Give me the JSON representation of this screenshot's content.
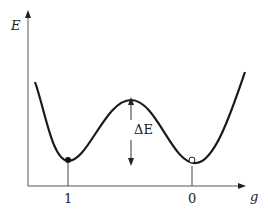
{
  "diagram": {
    "title": "",
    "y_axis_label": "E",
    "x_axis_label": "g",
    "barrier_label": "ΔE",
    "ticks": [
      {
        "label": "1",
        "description": "left minimum, filled marker"
      },
      {
        "label": "0",
        "description": "right minimum, open marker"
      }
    ],
    "curve": "double-well potential energy curve",
    "colors": {
      "line": "#1a1a1a",
      "background": "#ffffff"
    }
  }
}
